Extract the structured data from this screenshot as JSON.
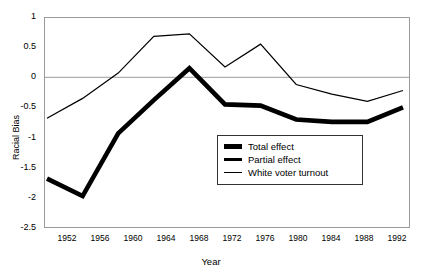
{
  "chart_data": {
    "type": "line",
    "title": "",
    "xlabel": "Year",
    "ylabel": "Racial Bias",
    "x": [
      1952,
      1956,
      1960,
      1964,
      1968,
      1972,
      1976,
      1980,
      1984,
      1988,
      1992
    ],
    "categories": [
      "1952",
      "1956",
      "1960",
      "1964",
      "1968",
      "1972",
      "1976",
      "1980",
      "1984",
      "1988",
      "1992"
    ],
    "xlim": [
      1950,
      1994
    ],
    "ylim": [
      -2.5,
      1
    ],
    "yticks": [
      "1",
      "0.5",
      "0",
      "-0.5",
      "-1",
      "-1.5",
      "-2",
      "-2.5"
    ],
    "ytick_values": [
      1,
      0.5,
      0,
      -0.5,
      -1,
      -1.5,
      -2,
      -2.5
    ],
    "grid": "horizontal gridlines at y=1 and y=0 only",
    "legend_position": "inside lower-right",
    "series": [
      {
        "name": "Total effect",
        "style": "very thick black line",
        "values": [
          -1.68,
          -1.97,
          -0.93,
          -0.38,
          0.15,
          -0.45,
          -0.47,
          -0.7,
          -0.74,
          -0.74,
          -0.5
        ]
      },
      {
        "name": "Partial effect",
        "style": "thick black line",
        "values": [
          -1.68,
          -1.97,
          -0.93,
          -0.38,
          0.15,
          -0.45,
          -0.47,
          -0.7,
          -0.74,
          -0.74,
          -0.5
        ]
      },
      {
        "name": "White voter turnout",
        "style": "thin black line",
        "values": [
          -0.68,
          -0.35,
          0.07,
          0.68,
          0.72,
          0.17,
          0.55,
          -0.12,
          -0.28,
          -0.4,
          -0.22
        ]
      }
    ]
  },
  "legend": {
    "items": [
      {
        "label": "Total effect",
        "swatch": "thick-line-swatch"
      },
      {
        "label": "Partial effect",
        "swatch": "medium-line-swatch"
      },
      {
        "label": "White voter turnout",
        "swatch": "thin-line-swatch"
      }
    ]
  },
  "axes": {
    "y_title": "Racial Bias",
    "x_title": "Year"
  }
}
